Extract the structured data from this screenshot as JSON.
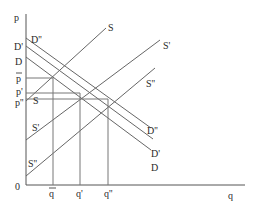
{
  "diagram": {
    "title": "",
    "axes": {
      "y_label": "p",
      "x_label": "q",
      "origin_label": "0"
    },
    "price_labels": {
      "p_bar": "p",
      "p_prime": "p'",
      "p_double_prime": "p''"
    },
    "quantity_labels": {
      "q_bar": "q",
      "q_prime": "q'",
      "q_double_prime": "q''"
    },
    "demand_curves": [
      {
        "name": "D",
        "left_label": "D",
        "right_label": "D"
      },
      {
        "name": "D'",
        "left_label": "D'",
        "right_label": "D'"
      },
      {
        "name": "D''",
        "left_label": "D''",
        "right_label": "D''"
      }
    ],
    "supply_curves": [
      {
        "name": "S",
        "left_label": "S",
        "right_label": "S"
      },
      {
        "name": "S'",
        "left_label": "S'",
        "right_label": "S'"
      },
      {
        "name": "S''",
        "left_label": "S''",
        "right_label": "S''"
      }
    ],
    "colors": {
      "line": "#666666",
      "axis": "#555555",
      "text": "#2a2a2a",
      "background": "#ffffff"
    }
  }
}
